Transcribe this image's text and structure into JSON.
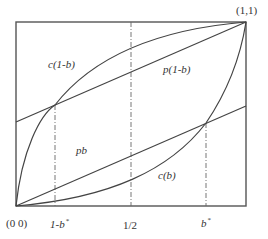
{
  "figure": {
    "type": "unit-square function diagram",
    "colors": {
      "axis": "#555555",
      "curve": "#444444",
      "dashed": "#666666",
      "text": "#333333"
    },
    "corner_labels": {
      "origin": "(0 0)",
      "top_right": "(1,1)"
    },
    "x_tick_labels": {
      "one_minus_bstar": "1-b",
      "one_minus_bstar_sup": "*",
      "half": "1/2",
      "bstar": "b",
      "bstar_sup": "*"
    },
    "curve_labels": {
      "c_one_minus_b": "c(1-b)",
      "p_one_minus_b": "p(1-b)",
      "pb": "pb",
      "c_b": "c(b)"
    },
    "geometry": {
      "box": {
        "x0": 16,
        "y0": 22,
        "x1": 246,
        "y1": 206
      },
      "p": 0.543,
      "dashed_x": {
        "one_minus_bstar": 0.17,
        "half": 0.5,
        "bstar": 0.826
      }
    }
  }
}
